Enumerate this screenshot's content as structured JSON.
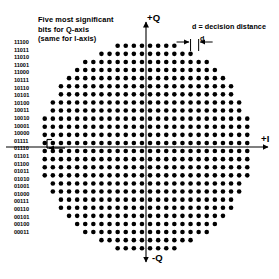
{
  "figure": {
    "title_note": [
      "Five most significant",
      "bits for Q-axis",
      "(same for I-axis)"
    ],
    "axis_labels": {
      "q_positive": "+Q",
      "q_negative": "-Q",
      "i_positive": "+I"
    },
    "decision_distance_note": "d = decision distance",
    "decision_distance_symbol": "d",
    "bit_labels": [
      "11100",
      "11011",
      "11010",
      "11001",
      "11000",
      "10111",
      "10110",
      "10101",
      "10100",
      "10011",
      "10010",
      "10001",
      "10000",
      "01111",
      "01110",
      "01101",
      "01100",
      "01011",
      "01010",
      "01001",
      "01000",
      "00111",
      "00110",
      "00101",
      "00100",
      "00011"
    ]
  },
  "chart_data": {
    "type": "scatter",
    "xlabel": "+I",
    "ylabel": "+Q",
    "grid": false,
    "legend": null,
    "marker": {
      "shape": "circle",
      "color": "#000000",
      "diameter_px": 4.6
    },
    "geometry": {
      "center_x_px": 146,
      "center_y_px": 147,
      "spacing_px": 8.1,
      "radius_in_spacings": 13.1,
      "x_offset_half": true,
      "y_offset_half": true
    },
    "axes": {
      "x_axis_y_px": 147,
      "y_axis_x_px": 146,
      "x_axis_from_px": 6,
      "x_axis_to_px": 268,
      "y_axis_from_px": 22,
      "y_axis_to_px": 262,
      "color": "#000000"
    },
    "annotations": [
      {
        "text": "d = decision distance",
        "x_px": 192,
        "y_px": 22
      },
      {
        "text": "d",
        "x_px": 200,
        "y_px": 34
      },
      {
        "text": "+Q",
        "x_px": 147,
        "y_px": 12
      },
      {
        "text": "-Q",
        "x_px": 152,
        "y_px": 252
      },
      {
        "text": "+I",
        "x_px": 261,
        "y_px": 133
      }
    ]
  }
}
